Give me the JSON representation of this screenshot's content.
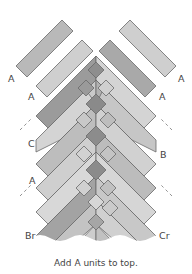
{
  "diagram": {
    "type": "herringbone quilt assembly diagram",
    "caption": "Add A units to top.",
    "labels": {
      "a_top_left": "A",
      "a_second_left": "A",
      "a_top_right": "A",
      "a_second_right": "A",
      "c_left": "C",
      "b_right": "B",
      "a_mid_left": "A",
      "br_left": "Br",
      "cr_right": "Cr"
    },
    "colors": {
      "light": "#cfcfcf",
      "lighter": "#dcdcdc",
      "medium": "#b5b5b5",
      "dark": "#979797",
      "darker": "#878787",
      "stroke": "#6a6a6a"
    }
  }
}
